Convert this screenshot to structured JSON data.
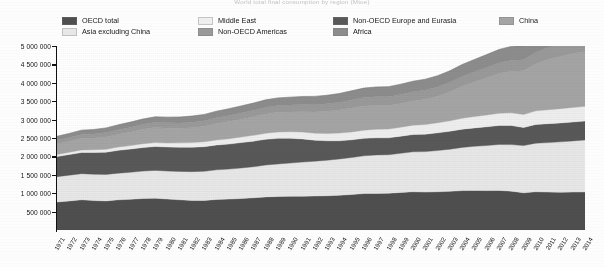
{
  "title": "World total final consumption by region (Mtoe)",
  "legend": {
    "items": [
      {
        "label": "OECD total",
        "color": "#4f4f4f",
        "col": 0,
        "row": 0
      },
      {
        "label": "Asia excluding China",
        "color": "#e8e8e8",
        "col": 0,
        "row": 1
      },
      {
        "label": "Middle East",
        "color": "#efefef",
        "col": 1,
        "row": 0
      },
      {
        "label": "Non-OECD Americas",
        "color": "#9a9a9a",
        "col": 1,
        "row": 1
      },
      {
        "label": "Non-OECD Europe and Eurasia",
        "color": "#595959",
        "col": 2,
        "row": 0
      },
      {
        "label": "Africa",
        "color": "#8d8d8d",
        "col": 2,
        "row": 1
      },
      {
        "label": "China",
        "color": "#a5a5a5",
        "col": 3,
        "row": 0
      }
    ]
  },
  "chart_data": {
    "type": "area",
    "stacked": true,
    "title": "World total final consumption by region (Mtoe)",
    "xlabel": "",
    "ylabel": "",
    "grid": false,
    "legend_position": "top",
    "ylim": [
      0,
      5000000
    ],
    "ytick_labels": [
      "5 000 000",
      "4 500 000",
      "4 000 000",
      "3 500 000",
      "3 000 000",
      "2 500 000",
      "2 000 000",
      "1 500 000",
      "1 000 000",
      "500 000"
    ],
    "yticks": [
      5000000,
      4500000,
      4000000,
      3500000,
      3000000,
      2500000,
      2000000,
      1500000,
      1000000,
      500000
    ],
    "x": [
      1971,
      1972,
      1973,
      1974,
      1975,
      1976,
      1977,
      1978,
      1979,
      1980,
      1981,
      1982,
      1983,
      1984,
      1985,
      1986,
      1987,
      1988,
      1989,
      1990,
      1991,
      1992,
      1993,
      1994,
      1995,
      1996,
      1997,
      1998,
      1999,
      2000,
      2001,
      2002,
      2003,
      2004,
      2005,
      2006,
      2007,
      2008,
      2009,
      2010,
      2011,
      2012,
      2013,
      2014
    ],
    "xtick_labels": [
      "1971",
      "1972",
      "1973",
      "1974",
      "1975",
      "1976",
      "1977",
      "1978",
      "1979",
      "1980",
      "1981",
      "1982",
      "1983",
      "1984",
      "1985",
      "1986",
      "1987",
      "1988",
      "1989",
      "1990",
      "1991",
      "1992",
      "1993",
      "1994",
      "1995",
      "1996",
      "1997",
      "1998",
      "1999",
      "2000",
      "2001",
      "2002",
      "2003",
      "2004",
      "2005",
      "2006",
      "2007",
      "2008",
      "2009",
      "2010",
      "2011",
      "2012",
      "2013",
      "2014"
    ],
    "series": [
      {
        "name": "OECD total",
        "color": "#4f4f4f",
        "values": [
          760000,
          790000,
          820000,
          800000,
          790000,
          820000,
          835000,
          855000,
          865000,
          840000,
          820000,
          805000,
          805000,
          830000,
          840000,
          855000,
          875000,
          900000,
          910000,
          915000,
          920000,
          925000,
          930000,
          945000,
          965000,
          990000,
          995000,
          1000000,
          1020000,
          1040000,
          1030000,
          1040000,
          1050000,
          1070000,
          1075000,
          1070000,
          1075000,
          1055000,
          1010000,
          1040000,
          1030000,
          1025000,
          1030000,
          1035000
        ]
      },
      {
        "name": "Asia excluding China",
        "color": "#e8e8e8",
        "values": [
          690000,
          700000,
          710000,
          715000,
          720000,
          725000,
          735000,
          745000,
          755000,
          760000,
          770000,
          780000,
          790000,
          805000,
          815000,
          830000,
          845000,
          865000,
          885000,
          905000,
          925000,
          945000,
          965000,
          985000,
          1005000,
          1025000,
          1045000,
          1045000,
          1065000,
          1085000,
          1100000,
          1120000,
          1145000,
          1175000,
          1200000,
          1225000,
          1250000,
          1265000,
          1285000,
          1320000,
          1345000,
          1370000,
          1390000,
          1410000
        ]
      },
      {
        "name": "Non-OECD Europe and Eurasia",
        "color": "#595959",
        "values": [
          545000,
          560000,
          575000,
          590000,
          605000,
          620000,
          630000,
          640000,
          650000,
          655000,
          660000,
          665000,
          670000,
          675000,
          680000,
          690000,
          695000,
          700000,
          695000,
          670000,
          630000,
          570000,
          530000,
          495000,
          480000,
          475000,
          465000,
          460000,
          465000,
          470000,
          475000,
          480000,
          490000,
          495000,
          500000,
          510000,
          515000,
          520000,
          490000,
          510000,
          515000,
          515000,
          515000,
          515000
        ]
      },
      {
        "name": "Middle East",
        "color": "#efefef",
        "values": [
          60000,
          65000,
          70000,
          75000,
          80000,
          88000,
          95000,
          102000,
          108000,
          112000,
          118000,
          125000,
          132000,
          138000,
          145000,
          152000,
          158000,
          165000,
          172000,
          178000,
          185000,
          192000,
          200000,
          208000,
          215000,
          222000,
          230000,
          238000,
          245000,
          252000,
          262000,
          272000,
          282000,
          295000,
          308000,
          320000,
          332000,
          345000,
          355000,
          368000,
          378000,
          388000,
          395000,
          402000
        ]
      },
      {
        "name": "China",
        "color": "#a5a5a5",
        "values": [
          290000,
          300000,
          315000,
          320000,
          335000,
          350000,
          370000,
          395000,
          405000,
          400000,
          395000,
          405000,
          420000,
          445000,
          470000,
          485000,
          505000,
          525000,
          535000,
          540000,
          555000,
          575000,
          600000,
          625000,
          650000,
          660000,
          650000,
          640000,
          645000,
          660000,
          685000,
          725000,
          790000,
          870000,
          940000,
          1010000,
          1080000,
          1130000,
          1190000,
          1280000,
          1370000,
          1420000,
          1465000,
          1490000
        ]
      },
      {
        "name": "Non-OECD Americas",
        "color": "#9a9a9a",
        "values": [
          95000,
          100000,
          108000,
          112000,
          118000,
          124000,
          130000,
          136000,
          142000,
          145000,
          147000,
          150000,
          152000,
          158000,
          162000,
          170000,
          175000,
          180000,
          185000,
          188000,
          193000,
          198000,
          205000,
          212000,
          220000,
          228000,
          236000,
          240000,
          242000,
          248000,
          250000,
          252000,
          256000,
          266000,
          274000,
          282000,
          292000,
          300000,
          298000,
          312000,
          320000,
          328000,
          334000,
          338000
        ]
      },
      {
        "name": "Africa",
        "color": "#8d8d8d",
        "values": [
          105000,
          110000,
          115000,
          120000,
          126000,
          132000,
          138000,
          144000,
          150000,
          155000,
          160000,
          166000,
          172000,
          178000,
          184000,
          190000,
          196000,
          202000,
          208000,
          214000,
          220000,
          226000,
          232000,
          240000,
          248000,
          256000,
          264000,
          272000,
          280000,
          288000,
          296000,
          304000,
          314000,
          326000,
          338000,
          350000,
          362000,
          374000,
          384000,
          398000,
          408000,
          420000,
          430000,
          440000
        ]
      }
    ]
  }
}
